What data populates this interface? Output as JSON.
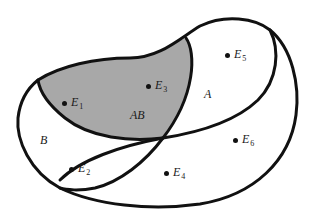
{
  "diagram": {
    "type": "venn-diagram",
    "colors": {
      "stroke": "#111111",
      "shaded_fill": "#a8a8a8",
      "background": "#ffffff"
    },
    "regions": [
      {
        "id": "A",
        "label": "A"
      },
      {
        "id": "B",
        "label": "B"
      },
      {
        "id": "AB",
        "label": "AB",
        "shaded": true
      }
    ],
    "points": [
      {
        "id": "E1",
        "base": "E",
        "sub": "1",
        "region": "AB"
      },
      {
        "id": "E2",
        "base": "E",
        "sub": "2",
        "region": "B"
      },
      {
        "id": "E3",
        "base": "E",
        "sub": "3",
        "region": "AB"
      },
      {
        "id": "E4",
        "base": "E",
        "sub": "4",
        "region": "outside"
      },
      {
        "id": "E5",
        "base": "E",
        "sub": "5",
        "region": "A"
      },
      {
        "id": "E6",
        "base": "E",
        "sub": "6",
        "region": "outside"
      }
    ]
  }
}
